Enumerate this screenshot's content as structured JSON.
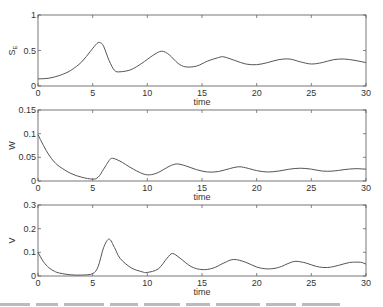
{
  "chart_data": [
    {
      "type": "line",
      "panel": "top",
      "ylabel": "S_E",
      "ylabel_main": "S",
      "ylabel_sub": "E",
      "xlabel": "time",
      "xlim": [
        0,
        30
      ],
      "ylim": [
        0,
        1
      ],
      "xticks": [
        0,
        5,
        10,
        15,
        20,
        25,
        30
      ],
      "yticks": [
        0,
        0.5,
        1
      ],
      "ytick_labels": [
        "0",
        "0.5",
        "1"
      ],
      "grid": false,
      "series": [
        {
          "name": "S_E",
          "x": [
            0,
            1,
            2,
            3,
            4,
            4.8,
            5.4,
            5.7,
            6.0,
            6.5,
            7.0,
            7.5,
            8.5,
            9.5,
            10.5,
            11.3,
            12.0,
            12.8,
            13.5,
            14.5,
            15.5,
            16.5,
            17.0,
            18.0,
            19.0,
            20.0,
            21.0,
            22.0,
            23.0,
            24.0,
            25.0,
            26.0,
            27.0,
            28.0,
            29.0,
            30.0
          ],
          "y": [
            0.1,
            0.11,
            0.15,
            0.22,
            0.34,
            0.49,
            0.6,
            0.61,
            0.56,
            0.36,
            0.22,
            0.2,
            0.23,
            0.32,
            0.43,
            0.49,
            0.44,
            0.32,
            0.27,
            0.28,
            0.35,
            0.4,
            0.41,
            0.36,
            0.31,
            0.3,
            0.33,
            0.37,
            0.38,
            0.34,
            0.31,
            0.33,
            0.37,
            0.38,
            0.36,
            0.33
          ]
        }
      ]
    },
    {
      "type": "line",
      "panel": "middle",
      "ylabel": "W",
      "xlabel": "time",
      "xlim": [
        0,
        30
      ],
      "ylim": [
        0,
        0.15
      ],
      "xticks": [
        0,
        5,
        10,
        15,
        20,
        25,
        30
      ],
      "yticks": [
        0,
        0.05,
        0.1,
        0.15
      ],
      "ytick_labels": [
        "0",
        "0.05",
        "0.1",
        "0.15"
      ],
      "grid": false,
      "series": [
        {
          "name": "W",
          "x": [
            0,
            0.5,
            1,
            1.5,
            2,
            3,
            4,
            5,
            5.5,
            6.0,
            6.5,
            6.8,
            7.5,
            8.5,
            9.5,
            10.2,
            11.0,
            12.0,
            12.7,
            13.5,
            14.5,
            15.5,
            16.5,
            17.5,
            18.3,
            19.0,
            20.0,
            21.0,
            22.0,
            23.0,
            24.0,
            25.0,
            26.0,
            27.0,
            28.0,
            29.0,
            30.0
          ],
          "y": [
            0.098,
            0.075,
            0.055,
            0.04,
            0.03,
            0.016,
            0.008,
            0.004,
            0.008,
            0.025,
            0.043,
            0.048,
            0.042,
            0.028,
            0.016,
            0.013,
            0.018,
            0.031,
            0.036,
            0.032,
            0.024,
            0.019,
            0.02,
            0.026,
            0.03,
            0.028,
            0.022,
            0.019,
            0.021,
            0.025,
            0.027,
            0.025,
            0.021,
            0.021,
            0.024,
            0.026,
            0.025
          ]
        }
      ]
    },
    {
      "type": "line",
      "panel": "bottom",
      "ylabel": "V",
      "xlabel": "time",
      "xlim": [
        0,
        30
      ],
      "ylim": [
        0,
        0.3
      ],
      "xticks": [
        0,
        5,
        10,
        15,
        20,
        25,
        30
      ],
      "yticks": [
        0,
        0.1,
        0.2,
        0.3
      ],
      "ytick_labels": [
        "0",
        "0.1",
        "0.2",
        "0.3"
      ],
      "grid": false,
      "series": [
        {
          "name": "V",
          "x": [
            0,
            0.5,
            1,
            1.5,
            2,
            3,
            4,
            5,
            5.5,
            6.0,
            6.5,
            7.0,
            7.5,
            8.5,
            9.5,
            10.0,
            11.0,
            11.8,
            12.3,
            13.0,
            14.0,
            15.0,
            16.0,
            17.0,
            17.9,
            19.0,
            20.0,
            21.0,
            22.0,
            23.0,
            23.6,
            24.5,
            25.5,
            26.5,
            27.5,
            28.5,
            29.5,
            30.0
          ],
          "y": [
            0.1,
            0.06,
            0.035,
            0.02,
            0.012,
            0.005,
            0.004,
            0.01,
            0.04,
            0.12,
            0.156,
            0.12,
            0.075,
            0.035,
            0.018,
            0.015,
            0.03,
            0.075,
            0.095,
            0.075,
            0.04,
            0.027,
            0.033,
            0.055,
            0.07,
            0.058,
            0.038,
            0.03,
            0.036,
            0.055,
            0.062,
            0.055,
            0.04,
            0.036,
            0.045,
            0.057,
            0.058,
            0.05
          ]
        }
      ]
    }
  ]
}
